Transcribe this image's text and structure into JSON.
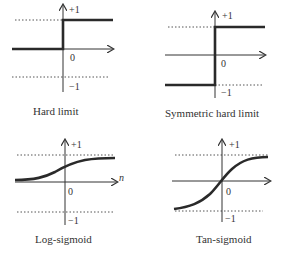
{
  "panels": [
    {
      "id": "hard-limit",
      "title": "Hard limit",
      "plus_one": "+1",
      "zero": "0",
      "minus_one": "−1"
    },
    {
      "id": "symmetric-hard-limit",
      "title": "Symmetric hard limit",
      "plus_one": "+1",
      "zero": "0",
      "minus_one": "−1"
    },
    {
      "id": "log-sigmoid",
      "title": "Log-sigmoid",
      "plus_one": "+1",
      "zero": "0",
      "minus_one": "−1",
      "x_axis_label": "n"
    },
    {
      "id": "tan-sigmoid",
      "title": "Tan-sigmoid",
      "plus_one": "+1",
      "zero": "0",
      "minus_one": "−1"
    }
  ],
  "colors": {
    "curve": "#2a2a2a",
    "axis": "#333333",
    "dotted": "#555555"
  }
}
